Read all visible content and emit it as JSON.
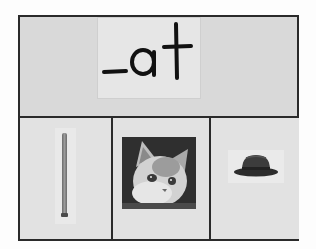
{
  "worksheet": {
    "word_family": "_at",
    "pictures": [
      {
        "name": "bat",
        "alt": "baseball bat"
      },
      {
        "name": "cat",
        "alt": "kitten face"
      },
      {
        "name": "hat",
        "alt": "fedora hat"
      }
    ]
  },
  "colors": {
    "border": "#2a2a2a",
    "board_bg": "#d9d9d9",
    "cell_bg": "#e2e2e2",
    "ink": "#111111"
  }
}
